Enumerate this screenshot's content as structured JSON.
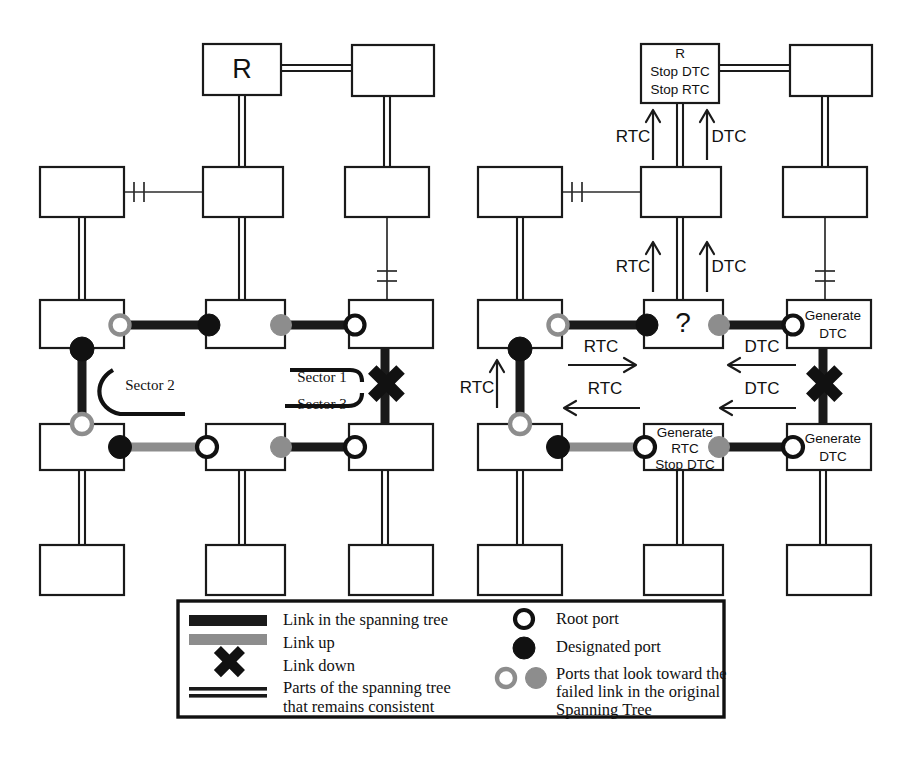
{
  "figure": {
    "type": "network-spanning-tree-diagram",
    "panels": [
      {
        "id": "left",
        "name": "original-topology-with-failed-link",
        "nodes": [
          {
            "id": "L-R",
            "labels": [
              "R"
            ]
          },
          {
            "id": "L-TR",
            "labels": []
          },
          {
            "id": "L-ML",
            "labels": []
          },
          {
            "id": "L-MC",
            "labels": []
          },
          {
            "id": "L-MR",
            "labels": []
          },
          {
            "id": "L-C1L",
            "labels": []
          },
          {
            "id": "L-C1C",
            "labels": []
          },
          {
            "id": "L-C1R",
            "labels": []
          },
          {
            "id": "L-C2L",
            "labels": []
          },
          {
            "id": "L-C2C",
            "labels": []
          },
          {
            "id": "L-C2R",
            "labels": []
          },
          {
            "id": "L-B1",
            "labels": []
          },
          {
            "id": "L-B2",
            "labels": []
          },
          {
            "id": "L-B3",
            "labels": []
          }
        ],
        "annotations": [
          {
            "id": "sector-2",
            "text": "Sector 2"
          },
          {
            "id": "sector-1",
            "text": "Sector 1"
          },
          {
            "id": "sector-3",
            "text": "Sector 3"
          }
        ]
      },
      {
        "id": "right",
        "name": "bpdu-propagation-after-failure",
        "nodes": [
          {
            "id": "R-R",
            "labels": [
              "R",
              "Stop DTC",
              "Stop RTC"
            ]
          },
          {
            "id": "R-TR",
            "labels": []
          },
          {
            "id": "R-ML",
            "labels": []
          },
          {
            "id": "R-MC",
            "labels": []
          },
          {
            "id": "R-MR",
            "labels": []
          },
          {
            "id": "R-C1L",
            "labels": []
          },
          {
            "id": "R-C1C",
            "labels": [
              "?"
            ]
          },
          {
            "id": "R-C1R",
            "labels": [
              "Generate",
              "DTC"
            ]
          },
          {
            "id": "R-C2L",
            "labels": []
          },
          {
            "id": "R-C2C",
            "labels": [
              "Generate",
              "RTC",
              "Stop DTC"
            ]
          },
          {
            "id": "R-C2R",
            "labels": [
              "Generate",
              "DTC"
            ]
          },
          {
            "id": "R-B1",
            "labels": []
          },
          {
            "id": "R-B2",
            "labels": []
          },
          {
            "id": "R-B3",
            "labels": []
          }
        ],
        "flows": [
          {
            "id": "flow-rtc-top-left",
            "text": "RTC",
            "direction": "up"
          },
          {
            "id": "flow-dtc-top-right",
            "text": "DTC",
            "direction": "up"
          },
          {
            "id": "flow-rtc-mid-left",
            "text": "RTC",
            "direction": "up"
          },
          {
            "id": "flow-dtc-mid-right",
            "text": "DTC",
            "direction": "up"
          },
          {
            "id": "flow-rtc-col-left",
            "text": "RTC",
            "direction": "up"
          },
          {
            "id": "flow-rtc-row1",
            "text": "RTC",
            "direction": "right"
          },
          {
            "id": "flow-dtc-row1",
            "text": "DTC",
            "direction": "left"
          },
          {
            "id": "flow-rtc-row2",
            "text": "RTC",
            "direction": "left"
          },
          {
            "id": "flow-dtc-row2",
            "text": "DTC",
            "direction": "left"
          }
        ]
      }
    ]
  },
  "legend": {
    "title": "",
    "left_items": [
      {
        "id": "link-in-spanning-tree",
        "icon": "thick-black-bar",
        "text": "Link in the spanning tree"
      },
      {
        "id": "link-up",
        "icon": "thick-gray-bar",
        "text": "Link up"
      },
      {
        "id": "link-down",
        "icon": "x-mark",
        "text": "Link down"
      },
      {
        "id": "parts-consistent",
        "icon": "double-line",
        "text": "Parts of the spanning tree"
      },
      {
        "id": "parts-consistent-2",
        "icon": "none",
        "text": "that remains consistent"
      }
    ],
    "right_items": [
      {
        "id": "root-port",
        "icon": "open-black-circle",
        "text": "Root port"
      },
      {
        "id": "designated-port",
        "icon": "filled-black-circle",
        "text": "Designated port"
      },
      {
        "id": "looking-ports",
        "icon": "gray-open-and-filled-circles",
        "text": "Ports that look toward the"
      },
      {
        "id": "looking-ports-2",
        "icon": "none",
        "text": "failed link in the original"
      },
      {
        "id": "looking-ports-3",
        "icon": "none",
        "text": "Spanning Tree"
      }
    ]
  },
  "colors": {
    "ink": "#111111",
    "gray": "#8d8d8d",
    "paper": "#ffffff"
  }
}
